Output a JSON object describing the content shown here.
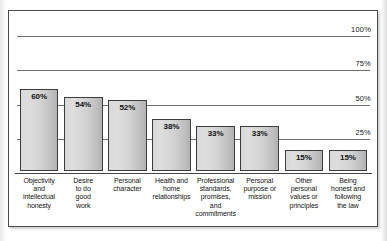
{
  "chart_data": {
    "type": "bar",
    "title": "",
    "subtitle": "",
    "xlabel": "",
    "ylabel": "",
    "ylim": [
      0,
      100
    ],
    "grid": true,
    "legend": null,
    "value_suffix": "%",
    "axis_ticks": [
      "100%",
      "75%",
      "50%",
      "25%"
    ],
    "axis_tick_values": [
      100,
      75,
      50,
      25
    ],
    "categories": [
      "Objectivity and intellectual honesty",
      "Desire to do good work",
      "Personal character",
      "Health and home relationships",
      "Professional standards, promises, and commitments",
      "Personal purpose or mission",
      "Other personal values or principles",
      "Being honest and following the law"
    ],
    "category_lines": [
      [
        "Objectivity",
        "and",
        "intellectual",
        "honesty"
      ],
      [
        "Desire",
        "to do",
        "good",
        "work"
      ],
      [
        "Personal",
        "character"
      ],
      [
        "Health and",
        "home",
        "relationships"
      ],
      [
        "Professional",
        "standards,",
        "promises,",
        "and",
        "commitments"
      ],
      [
        "Personal",
        "purpose or",
        "mission"
      ],
      [
        "Other",
        "personal",
        "values or",
        "principles"
      ],
      [
        "Being",
        "honest and",
        "following",
        "the law"
      ]
    ],
    "values": [
      60,
      54,
      52,
      38,
      33,
      33,
      15,
      15
    ],
    "value_labels": [
      "60%",
      "54%",
      "52%",
      "38%",
      "33%",
      "33%",
      "15%",
      "15%"
    ],
    "colors": {
      "bar_fill_light": "#dedede",
      "bar_fill_dark": "#b2b2b2",
      "bar_border": "#3d3d3d",
      "gridline": "#6f6f6f",
      "axis": "#444444",
      "frame_border": "#4a4a4a",
      "background": "#ffffff",
      "text": "#141414"
    }
  }
}
